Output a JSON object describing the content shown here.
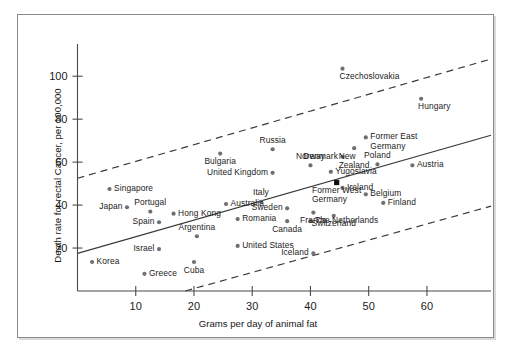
{
  "chart_data": {
    "type": "scatter",
    "title": "",
    "xlabel": "Grams per day of animal fat",
    "ylabel": "Death rate for rectal Cancer, per 100,000",
    "xlim": [
      0,
      71
    ],
    "ylim": [
      0,
      115
    ],
    "xticks": [
      10,
      20,
      30,
      40,
      50,
      60
    ],
    "yticks": [
      20,
      40,
      60,
      80,
      100
    ],
    "grid": false,
    "legend": "none",
    "lines": [
      {
        "name": "regression-line",
        "style": "solid",
        "x": [
          0,
          71
        ],
        "y": [
          17.5,
          72.5
        ]
      },
      {
        "name": "upper-band",
        "style": "dashed",
        "x": [
          0,
          71
        ],
        "y": [
          52.5,
          108.0
        ]
      },
      {
        "name": "lower-band",
        "style": "dashed",
        "x": [
          18.5,
          71
        ],
        "y": [
          0.0,
          39.5
        ]
      }
    ],
    "points": [
      {
        "label": "Korea",
        "x": 2.5,
        "y": 13.5,
        "pos": "right"
      },
      {
        "label": "Japan",
        "x": 8.5,
        "y": 39.0,
        "pos": "left"
      },
      {
        "label": "Singapore",
        "x": 5.5,
        "y": 47.5,
        "pos": "right"
      },
      {
        "label": "Portugal",
        "x": 12.5,
        "y": 37.0,
        "pos": "above-center"
      },
      {
        "label": "Spain",
        "x": 14.0,
        "y": 32.0,
        "pos": "left"
      },
      {
        "label": "Israel",
        "x": 14.0,
        "y": 19.5,
        "pos": "left"
      },
      {
        "label": "Greece",
        "x": 11.5,
        "y": 8.0,
        "pos": "right"
      },
      {
        "label": "Hong Kong",
        "x": 16.5,
        "y": 36.0,
        "pos": "right"
      },
      {
        "label": "Argentina",
        "x": 20.5,
        "y": 25.5,
        "pos": "above-center"
      },
      {
        "label": "Cuba",
        "x": 20.0,
        "y": 13.5,
        "pos": "below-center"
      },
      {
        "label": "Bulgaria",
        "x": 24.5,
        "y": 64.0,
        "pos": "below-center"
      },
      {
        "label": "Australia",
        "x": 25.5,
        "y": 40.5,
        "pos": "right"
      },
      {
        "label": "Romania",
        "x": 27.5,
        "y": 33.5,
        "pos": "right"
      },
      {
        "label": "United States",
        "x": 27.5,
        "y": 21.0,
        "pos": "right"
      },
      {
        "label": "Italy",
        "x": 31.5,
        "y": 41.5,
        "pos": "above-center"
      },
      {
        "label": "United Kingdom",
        "x": 33.5,
        "y": 55.0,
        "pos": "left"
      },
      {
        "label": "Russia",
        "x": 33.5,
        "y": 66.0,
        "pos": "above-center"
      },
      {
        "label": "Sweden",
        "x": 36.0,
        "y": 38.5,
        "pos": "left"
      },
      {
        "label": "Canada",
        "x": 36.0,
        "y": 32.5,
        "pos": "below-center"
      },
      {
        "label": "Norway",
        "x": 40.0,
        "y": 58.5,
        "pos": "above-center"
      },
      {
        "label": "France",
        "x": 40.5,
        "y": 36.5,
        "pos": "below-center"
      },
      {
        "label": "The Netherlands",
        "x": 40.0,
        "y": 32.5,
        "pos": "right"
      },
      {
        "label": "Iceland",
        "x": 40.5,
        "y": 17.5,
        "pos": "left"
      },
      {
        "label": "Yugoslavia",
        "x": 43.5,
        "y": 55.5,
        "pos": "right"
      },
      {
        "label": "Former West\nGermany",
        "x": 44.5,
        "y": 50.5,
        "pos": "below-center",
        "highlight": true
      },
      {
        "label": "Switzerland",
        "x": 44.0,
        "y": 35.0,
        "pos": "below-center"
      },
      {
        "label": "Denmark",
        "x": 45.5,
        "y": 62.5,
        "pos": "left"
      },
      {
        "label": "Ireland",
        "x": 45.5,
        "y": 48.0,
        "pos": "right"
      },
      {
        "label": "Czechoslovakia",
        "x": 45.5,
        "y": 103.5,
        "pos": "below-right"
      },
      {
        "label": "New\nZealand",
        "x": 47.5,
        "y": 66.5,
        "pos": "below-center"
      },
      {
        "label": "Former East\nGermany",
        "x": 49.5,
        "y": 71.5,
        "pos": "right"
      },
      {
        "label": "Belgium",
        "x": 49.5,
        "y": 45.0,
        "pos": "right"
      },
      {
        "label": "Poland",
        "x": 51.5,
        "y": 59.0,
        "pos": "above-center"
      },
      {
        "label": "Finland",
        "x": 52.5,
        "y": 41.0,
        "pos": "right"
      },
      {
        "label": "Hungary",
        "x": 59.0,
        "y": 89.5,
        "pos": "below-right"
      },
      {
        "label": "Austria",
        "x": 57.5,
        "y": 58.5,
        "pos": "right"
      }
    ]
  }
}
